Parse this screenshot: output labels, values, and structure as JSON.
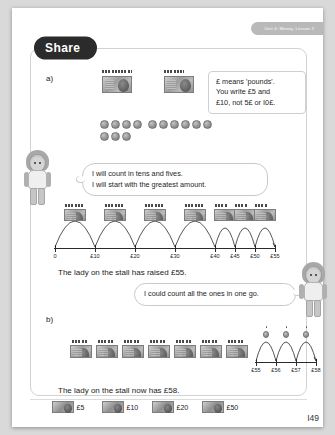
{
  "header": {
    "unit_label": "Unit 4: Money, Lesson 2"
  },
  "banner": {
    "label": "Share"
  },
  "parts": {
    "a_label": "a)",
    "b_label": "b)"
  },
  "info_box": {
    "line1": "£ means 'pounds'.",
    "line2": "You write £5 and",
    "line3": "£10, not 5£ or I0£."
  },
  "bubbles": {
    "left": {
      "line1": "I will count in tens and fives.",
      "line2": "I will start with the greatest amount."
    },
    "right": {
      "line1": "I could count all the ones in one go."
    }
  },
  "sentences": {
    "a_result": "The lady on the stall has raised £55.",
    "b_result": "The lady on the stall now has £58."
  },
  "chart_data": [
    {
      "type": "numberline",
      "id": "numberline-a",
      "title": "Counting in tens and fives to £55",
      "ticks": [
        0,
        10,
        20,
        30,
        40,
        45,
        50,
        55
      ],
      "tick_labels": [
        "0",
        "£10",
        "£20",
        "£30",
        "£40",
        "£45",
        "£50",
        "£55"
      ],
      "xlim": [
        0,
        55
      ],
      "jumps": [
        {
          "from": 0,
          "to": 10,
          "size": 10
        },
        {
          "from": 10,
          "to": 20,
          "size": 10
        },
        {
          "from": 20,
          "to": 30,
          "size": 10
        },
        {
          "from": 30,
          "to": 40,
          "size": 10
        },
        {
          "from": 40,
          "to": 45,
          "size": 5
        },
        {
          "from": 45,
          "to": 50,
          "size": 5
        },
        {
          "from": 50,
          "to": 55,
          "size": 5
        }
      ],
      "notes_above": [
        "£10",
        "£10",
        "£10",
        "£10",
        "£5",
        "£5",
        "£5"
      ],
      "total": "£55"
    },
    {
      "type": "numberline",
      "id": "numberline-b",
      "title": "Counting on in ones from £55 to £58",
      "ticks": [
        55,
        56,
        57,
        58
      ],
      "tick_labels": [
        "£55",
        "£56",
        "£57",
        "£58"
      ],
      "xlim": [
        55,
        58
      ],
      "jumps": [
        {
          "from": 55,
          "to": 56,
          "size": 1
        },
        {
          "from": 56,
          "to": 57,
          "size": 1
        },
        {
          "from": 57,
          "to": 58,
          "size": 1
        }
      ],
      "coins_above": [
        "£1",
        "£1",
        "£1"
      ],
      "total": "£58"
    }
  ],
  "money_a": {
    "note_groups": [
      {
        "denomination": "£10",
        "count": 4,
        "stack_marks": 9
      },
      {
        "denomination": "£5",
        "count": 3,
        "stack_marks": 5
      }
    ],
    "coins_row1": 10,
    "coins_row2": 3,
    "coin_total_label": "£1 coins"
  },
  "money_b": {
    "note_count": 7,
    "coin_count": 3
  },
  "footer": {
    "key": [
      {
        "label": "£5"
      },
      {
        "label": "£10"
      },
      {
        "label": "£20"
      },
      {
        "label": "£50"
      }
    ],
    "page_number": "I49"
  }
}
